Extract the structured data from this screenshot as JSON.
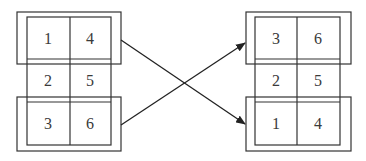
{
  "diagram": {
    "stroke_color": "#333333",
    "text_color": "#3a3a3a",
    "left_grid": {
      "rows": [
        {
          "cells": [
            "1",
            "4"
          ],
          "grouped": true
        },
        {
          "cells": [
            "2",
            "5"
          ],
          "grouped": false
        },
        {
          "cells": [
            "3",
            "6"
          ],
          "grouped": true
        }
      ]
    },
    "right_grid": {
      "rows": [
        {
          "cells": [
            "3",
            "6"
          ],
          "grouped": true
        },
        {
          "cells": [
            "2",
            "5"
          ],
          "grouped": false
        },
        {
          "cells": [
            "1",
            "4"
          ],
          "grouped": true
        }
      ]
    },
    "arrows": [
      {
        "from": "left top row (1,4)",
        "to": "right bottom row (1,4)"
      },
      {
        "from": "left bottom row (3,6)",
        "to": "right top row (3,6)"
      }
    ]
  }
}
